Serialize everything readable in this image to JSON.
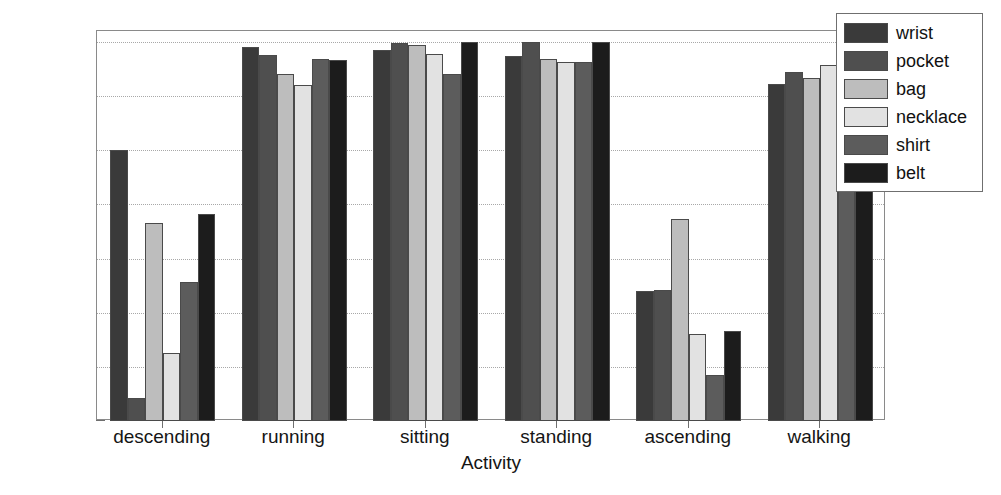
{
  "chart_data": {
    "type": "bar",
    "title": "",
    "xlabel": "Activity",
    "ylabel": "Classification accuracy (%)",
    "categories": [
      "descending",
      "running",
      "sitting",
      "standing",
      "ascending",
      "walking"
    ],
    "ylim": [
      30,
      102
    ],
    "yticks": [
      30,
      40,
      50,
      60,
      70,
      80,
      90,
      100
    ],
    "ytick_labels": [
      "30",
      "40",
      "50",
      "60",
      "70",
      "80",
      "90",
      "100"
    ],
    "grid": "horizontal-dotted",
    "legend_position": "upper-right-outside",
    "series": [
      {
        "name": "wrist",
        "color": "#3a3a3a",
        "values": [
          80.0,
          99.0,
          98.5,
          97.4,
          54.0,
          92.3
        ]
      },
      {
        "name": "pocket",
        "color": "#4f4f4f",
        "values": [
          34.2,
          97.5,
          99.8,
          99.9,
          54.1,
          94.5
        ]
      },
      {
        "name": "bag",
        "color": "#bdbdbd",
        "values": [
          66.5,
          94.0,
          99.5,
          96.9,
          67.3,
          93.3
        ]
      },
      {
        "name": "necklace",
        "color": "#e2e2e2",
        "values": [
          42.5,
          92.0,
          97.7,
          96.3,
          46.0,
          95.8
        ]
      },
      {
        "name": "shirt",
        "color": "#5c5c5c",
        "values": [
          55.7,
          96.8,
          94.0,
          96.2,
          38.5,
          95.6
        ]
      },
      {
        "name": "belt",
        "color": "#1c1c1c",
        "values": [
          68.3,
          96.7,
          99.9,
          99.9,
          46.7,
          92.7
        ]
      }
    ]
  },
  "legend": {
    "items": [
      {
        "label": "wrist"
      },
      {
        "label": "pocket"
      },
      {
        "label": "bag"
      },
      {
        "label": "necklace"
      },
      {
        "label": "shirt"
      },
      {
        "label": "belt"
      }
    ]
  }
}
